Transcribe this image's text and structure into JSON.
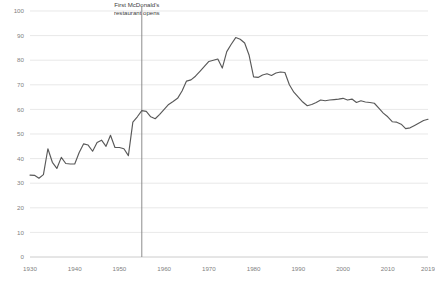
{
  "chart_data": {
    "type": "line",
    "title": "",
    "subtitle": "",
    "xlabel": "",
    "ylabel": "",
    "xlim": [
      1930,
      2019
    ],
    "ylim": [
      0,
      100
    ],
    "grid": true,
    "grid_axis": "y",
    "legend": false,
    "legend_position": "none",
    "line_color": "#595959",
    "gridline_color": "#d9d9d9",
    "tick_label_color": "#7f7f7f",
    "xticks": [
      1930,
      1940,
      1950,
      1960,
      1970,
      1980,
      1990,
      2000,
      2010,
      2019
    ],
    "xtick_labels": [
      "1930",
      "1940",
      "1950",
      "1960",
      "1970",
      "1980",
      "1990",
      "2000",
      "2010",
      "2019"
    ],
    "yticks": [
      0,
      10,
      20,
      30,
      40,
      50,
      60,
      70,
      80,
      90,
      100
    ],
    "ytick_labels": [
      "0",
      "10",
      "20",
      "30",
      "40",
      "50",
      "60",
      "70",
      "80",
      "90",
      "100"
    ],
    "annotations": [
      {
        "name": "first-mcdonalds-marker",
        "text_line1": "First McDonald's",
        "text_line2": "restaurant opens",
        "x": 1955,
        "line_color": "#808080",
        "text_color": "#404040"
      }
    ],
    "x": [
      1930,
      1931,
      1932,
      1933,
      1934,
      1935,
      1936,
      1937,
      1938,
      1939,
      1940,
      1941,
      1942,
      1943,
      1944,
      1945,
      1946,
      1947,
      1948,
      1949,
      1950,
      1951,
      1952,
      1953,
      1954,
      1955,
      1956,
      1957,
      1958,
      1959,
      1960,
      1961,
      1962,
      1963,
      1964,
      1965,
      1966,
      1967,
      1968,
      1969,
      1970,
      1971,
      1972,
      1973,
      1974,
      1975,
      1976,
      1977,
      1978,
      1979,
      1980,
      1981,
      1982,
      1983,
      1984,
      1985,
      1986,
      1987,
      1988,
      1989,
      1990,
      1991,
      1992,
      1993,
      1994,
      1995,
      1996,
      1997,
      1998,
      1999,
      2000,
      2001,
      2002,
      2003,
      2004,
      2005,
      2006,
      2007,
      2008,
      2009,
      2010,
      2011,
      2012,
      2013,
      2014,
      2015,
      2016,
      2017,
      2018,
      2019
    ],
    "series": [
      {
        "name": "value",
        "values": [
          33.3,
          33.2,
          32.0,
          33.5,
          44.0,
          38.5,
          36.0,
          40.5,
          38.0,
          37.8,
          37.8,
          42.5,
          46.0,
          45.5,
          43.0,
          46.5,
          47.5,
          45.0,
          49.5,
          44.5,
          44.5,
          44.0,
          41.2,
          54.8,
          57.0,
          59.5,
          59.2,
          57.0,
          56.2,
          58.0,
          60.0,
          62.0,
          63.2,
          64.5,
          67.5,
          71.5,
          72.0,
          73.5,
          75.5,
          77.5,
          79.5,
          80.0,
          80.5,
          76.8,
          83.5,
          86.5,
          89.2,
          88.5,
          87.0,
          82.0,
          73.2,
          73.0,
          74.0,
          74.5,
          73.8,
          74.8,
          75.2,
          75.0,
          70.0,
          67.0,
          65.0,
          63.0,
          61.5,
          62.0,
          62.8,
          63.8,
          63.5,
          63.8,
          64.0,
          64.2,
          64.5,
          63.8,
          64.2,
          62.8,
          63.5,
          63.0,
          62.8,
          62.5,
          60.5,
          58.5,
          57.0,
          55.0,
          54.8,
          54.0,
          52.2,
          52.5,
          53.5,
          54.5,
          55.5,
          56.0
        ]
      }
    ]
  }
}
